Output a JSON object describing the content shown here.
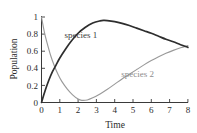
{
  "chart_data": {
    "type": "line",
    "title": "",
    "xlabel": "Time",
    "ylabel": "Population",
    "xlim": [
      0,
      8
    ],
    "ylim": [
      0,
      1
    ],
    "xticks": [
      0,
      1,
      2,
      3,
      4,
      5,
      6,
      7,
      8
    ],
    "xtick_labels": [
      "0",
      "1",
      "2",
      "3",
      "4",
      "5",
      "6",
      "7",
      "8"
    ],
    "yticks": [
      0,
      0.2,
      0.4,
      0.6,
      0.8,
      1
    ],
    "ytick_labels": [
      "0",
      "0.2",
      "0.4",
      "0.6",
      "0.8",
      "1"
    ],
    "grid": false,
    "legend_position": "inline-annotation",
    "series": [
      {
        "name": "species 1",
        "color": "#2e2e2e",
        "annotation": "species 1",
        "annotation_x": 2.15,
        "annotation_y": 0.76,
        "x": [
          0,
          0.2,
          0.4,
          0.6,
          0.8,
          1.0,
          1.3,
          1.6,
          2.0,
          2.4,
          2.8,
          3.2,
          3.4,
          3.6,
          4.0,
          4.4,
          4.8,
          5.2,
          5.6,
          6.0,
          6.4,
          6.8,
          7.2,
          7.6,
          8.0
        ],
        "y": [
          0.0,
          0.14,
          0.26,
          0.36,
          0.44,
          0.52,
          0.62,
          0.71,
          0.81,
          0.88,
          0.93,
          0.955,
          0.96,
          0.958,
          0.945,
          0.925,
          0.9,
          0.87,
          0.84,
          0.81,
          0.775,
          0.74,
          0.71,
          0.675,
          0.645
        ]
      },
      {
        "name": "species 2",
        "color": "#9a9a9a",
        "annotation": "species 2",
        "annotation_x": 5.25,
        "annotation_y": 0.3,
        "x": [
          0,
          0.15,
          0.3,
          0.5,
          0.7,
          0.9,
          1.1,
          1.4,
          1.7,
          2.0,
          2.2,
          2.5,
          2.8,
          3.2,
          3.6,
          4.0,
          4.4,
          4.8,
          5.2,
          5.6,
          6.0,
          6.4,
          6.8,
          7.2,
          7.6,
          8.0
        ],
        "y": [
          1.0,
          0.83,
          0.7,
          0.55,
          0.43,
          0.33,
          0.25,
          0.16,
          0.09,
          0.04,
          0.025,
          0.03,
          0.055,
          0.1,
          0.155,
          0.215,
          0.275,
          0.33,
          0.385,
          0.44,
          0.49,
          0.535,
          0.575,
          0.61,
          0.64,
          0.665
        ]
      }
    ]
  },
  "axes": {
    "y_axis_title": "Population",
    "x_axis_title": "Time"
  }
}
